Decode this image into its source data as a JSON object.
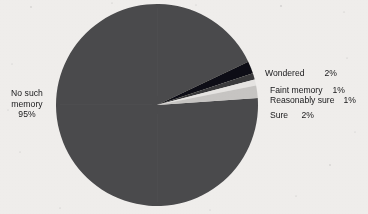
{
  "chart_data": {
    "type": "pie",
    "title": "",
    "categories": [
      "No such memory",
      "Wondered",
      "Faint memory",
      "Reasonably sure",
      "Sure"
    ],
    "values": [
      95,
      2,
      1,
      1,
      2
    ],
    "value_labels": [
      "95%",
      "2%",
      "1%",
      "1%",
      "2%"
    ],
    "colors": [
      "#4b4b4d",
      "#111113",
      "#3a3a3c",
      "#e9e7e5",
      "#c9c7c5"
    ],
    "legend_position": "right",
    "grid": false,
    "start_angle_deg": -4,
    "direction": "clockwise"
  },
  "chart": {
    "main_slice": {
      "name_line1": "No such",
      "name_line2": "memory",
      "percent": "95%"
    },
    "legend": [
      {
        "label": "Wondered",
        "percent": "2%"
      },
      {
        "label": "Faint memory",
        "percent": "1%"
      },
      {
        "label": "Reasonably sure",
        "percent": "1%"
      },
      {
        "label": "Sure",
        "percent": "2%"
      }
    ]
  }
}
